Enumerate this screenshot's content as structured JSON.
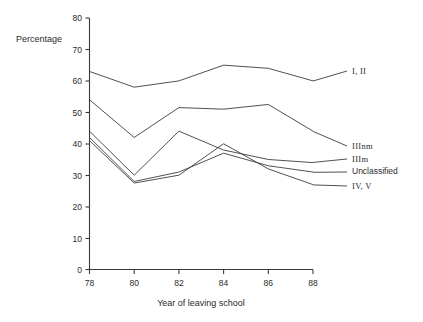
{
  "chart_data": {
    "type": "line",
    "title": "",
    "xlabel": "Year of leaving school",
    "ylabel": "Percentage",
    "x": [
      78,
      80,
      82,
      84,
      86,
      88
    ],
    "xtick_labels": [
      "78",
      "80",
      "82",
      "84",
      "86",
      "88"
    ],
    "ytick_labels": [
      "0",
      "10",
      "20",
      "30",
      "40",
      "50",
      "60",
      "70",
      "80"
    ],
    "ylim": [
      0,
      80
    ],
    "xlim": [
      78,
      88
    ],
    "ytick_step": 10,
    "grid": false,
    "legend_position": "right-of-plot-with-leader-lines",
    "series": [
      {
        "name": "I, II",
        "values": [
          63,
          58,
          60,
          65,
          64,
          60
        ]
      },
      {
        "name": "IIInm",
        "values": [
          54,
          42,
          51.5,
          51,
          52.5,
          44
        ]
      },
      {
        "name": "IIIm",
        "values": [
          44,
          30,
          44,
          38,
          35,
          34
        ]
      },
      {
        "name": "Unclassified",
        "values": [
          42,
          28,
          31,
          37,
          33,
          31
        ]
      },
      {
        "name": "IV, V",
        "values": [
          41,
          27.5,
          30,
          40,
          32,
          27
        ]
      }
    ],
    "line_color": "#3d3d3d",
    "axis_color": "#3a3a3a"
  },
  "axes": {
    "y_title": "Percentage",
    "x_title": "Year of leaving school",
    "y_ticks": [
      "80",
      "70",
      "60",
      "50",
      "40",
      "30",
      "20",
      "10",
      "0"
    ],
    "x_ticks": [
      "78",
      "80",
      "82",
      "84",
      "86",
      "88"
    ]
  },
  "legend": {
    "items": [
      {
        "label": "I, II"
      },
      {
        "label": "IIInm"
      },
      {
        "label": "IIIm"
      },
      {
        "label": "Unclassified"
      },
      {
        "label": "IV, V"
      }
    ]
  }
}
